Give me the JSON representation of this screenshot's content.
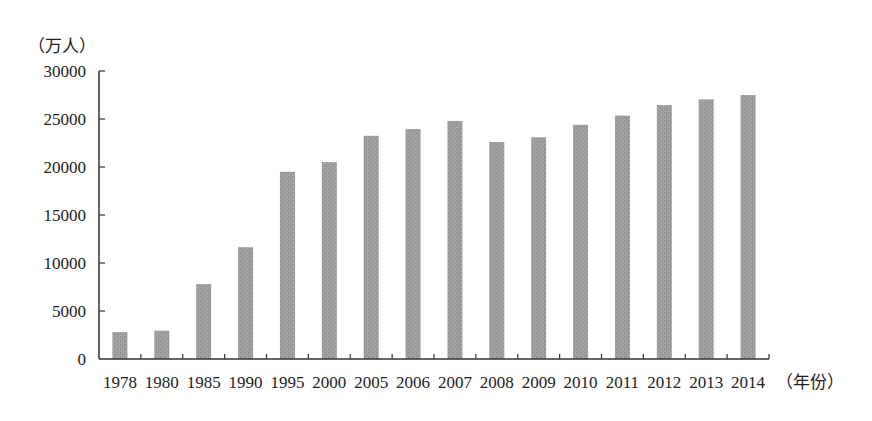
{
  "chart_data": {
    "type": "bar",
    "title": "",
    "ylabel": "（万人）",
    "xlabel": "（年份）",
    "ylim": [
      0,
      30000
    ],
    "yticks": [
      0,
      5000,
      10000,
      15000,
      20000,
      25000,
      30000
    ],
    "grid": false,
    "legend": null,
    "categories": [
      "1978",
      "1980",
      "1985",
      "1990",
      "1995",
      "2000",
      "2005",
      "2006",
      "2007",
      "2008",
      "2009",
      "2010",
      "2011",
      "2012",
      "2013",
      "2014"
    ],
    "values": [
      2800,
      2950,
      7800,
      11650,
      19500,
      20500,
      23250,
      23950,
      24800,
      22600,
      23100,
      24400,
      25350,
      26450,
      27050,
      27500
    ],
    "bar_color": "#9b9b9b"
  },
  "labels": {
    "y_unit": "（万人）",
    "x_unit": "（年份）"
  }
}
